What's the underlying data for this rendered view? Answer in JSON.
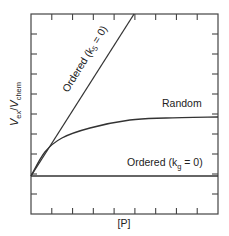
{
  "chart_data": {
    "type": "line",
    "title": "",
    "xlabel": "[P]",
    "ylabel": {
      "main": "V",
      "sub1": "ex",
      "slash": "/",
      "main2": "V",
      "sub2": "chem"
    },
    "xlim": [
      0,
      9
    ],
    "ylim": [
      0,
      10
    ],
    "x_ticks": [
      1,
      2,
      3,
      4,
      5,
      6,
      7,
      8
    ],
    "y_ticks": [
      1,
      2,
      3,
      4,
      5,
      6,
      7,
      8,
      9
    ],
    "tick_labels_shown": false,
    "grid": false,
    "line_color": "#333333",
    "series": [
      {
        "name": "Ordered (k5 = 0)",
        "label_parts": {
          "pre": "Ordered (k",
          "sub": "5",
          "post": " = 0)"
        },
        "points": [
          [
            0,
            1.9
          ],
          [
            4.96,
            10
          ]
        ]
      },
      {
        "name": "Random",
        "label_parts": {
          "pre": "Random",
          "sub": "",
          "post": ""
        },
        "points": [
          [
            0,
            1.9
          ],
          [
            0.67,
            3.1
          ],
          [
            1.49,
            3.8
          ],
          [
            2.84,
            4.3
          ],
          [
            4.76,
            4.7
          ],
          [
            6.5,
            4.8
          ],
          [
            9,
            4.85
          ]
        ]
      },
      {
        "name": "Ordered (kg = 0)",
        "label_parts": {
          "pre": "Ordered (k",
          "sub": "g",
          "post": " = 0)"
        },
        "points": [
          [
            0,
            1.9
          ],
          [
            9,
            1.9
          ]
        ]
      }
    ]
  }
}
